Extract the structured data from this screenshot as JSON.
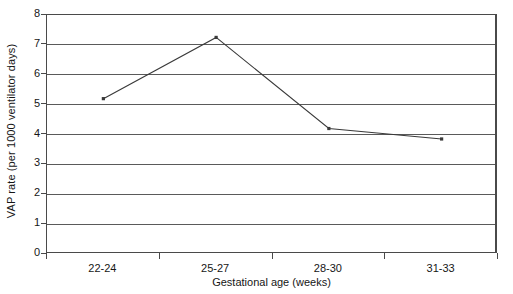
{
  "chart_data": {
    "type": "line",
    "title": "",
    "xlabel": "Gestational age (weeks)",
    "ylabel": "VAP rate (per 1000 ventilator days)",
    "categories": [
      "22-24",
      "25-27",
      "28-30",
      "31-33"
    ],
    "series": [
      {
        "name": "VAP rate",
        "values": [
          5.2,
          7.25,
          4.2,
          3.85
        ]
      }
    ],
    "ylim": [
      0,
      8
    ],
    "yticks": [
      0,
      1,
      2,
      3,
      4,
      5,
      6,
      7,
      8
    ],
    "ytick_labels": [
      "0",
      "1",
      "2",
      "3",
      "4",
      "5",
      "6",
      "7",
      "8"
    ],
    "grid": "horizontal",
    "legend": "none",
    "marker": "small-square",
    "line_color": "#3a3a3a",
    "grid_color": "#5a5a5a",
    "axis_color": "#4a4a4a",
    "background": "#ffffff"
  }
}
